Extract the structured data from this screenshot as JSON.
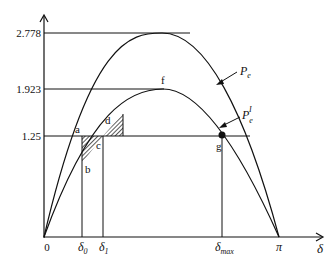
{
  "diagram": {
    "type": "power-angle curve (equal area criterion)",
    "axes": {
      "x_label": "δ",
      "origin_label": "0",
      "x_ticks": [
        {
          "label": "δ",
          "sub": "0"
        },
        {
          "label": "δ",
          "sub": "1"
        },
        {
          "label": "δ",
          "sub": "max"
        },
        {
          "label": "π",
          "sub": ""
        }
      ],
      "y_ticks": [
        "2.778",
        "1.923",
        "1.25"
      ]
    },
    "curves": [
      {
        "name": "Pe",
        "label_main": "P",
        "label_sub": "e",
        "label_sup": "",
        "peak": 2.778
      },
      {
        "name": "Pe'",
        "label_main": "P",
        "label_sub": "e",
        "label_sup": "I",
        "peak": 1.923
      }
    ],
    "points": {
      "a": "a",
      "b": "b",
      "c": "c",
      "d": "d",
      "f": "f",
      "g": "g"
    },
    "mechanical_power": 1.25
  }
}
